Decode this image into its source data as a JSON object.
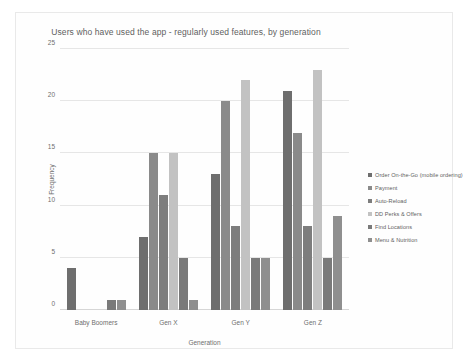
{
  "chart_data": {
    "type": "bar",
    "title": "Users who have used the app - regularly used features, by generation",
    "xlabel": "Generation",
    "ylabel": "Frequency",
    "ylim": [
      0,
      25
    ],
    "yticks": [
      0,
      5,
      10,
      15,
      20,
      25
    ],
    "grid": true,
    "legend_position": "right",
    "categories": [
      "Baby Boomers",
      "Gen X",
      "Gen Y",
      "Gen Z"
    ],
    "series": [
      {
        "name": "Order On-the-Go (mobile ordering)",
        "color": "#6e6e6e",
        "values": [
          4,
          7,
          13,
          21
        ]
      },
      {
        "name": "Payment",
        "color": "#8a8a8a",
        "values": [
          0,
          15,
          20,
          17
        ]
      },
      {
        "name": "Auto-Reload",
        "color": "#7d7d7d",
        "values": [
          0,
          11,
          8,
          8
        ]
      },
      {
        "name": "DD Perks & Offers",
        "color": "#c2c2c2",
        "values": [
          0,
          15,
          22,
          23
        ]
      },
      {
        "name": "Find Locations",
        "color": "#7a7a7a",
        "values": [
          1,
          5,
          5,
          5
        ]
      },
      {
        "name": "Menu & Nutrition",
        "color": "#8f8f8f",
        "values": [
          1,
          1,
          5,
          9
        ]
      }
    ]
  }
}
